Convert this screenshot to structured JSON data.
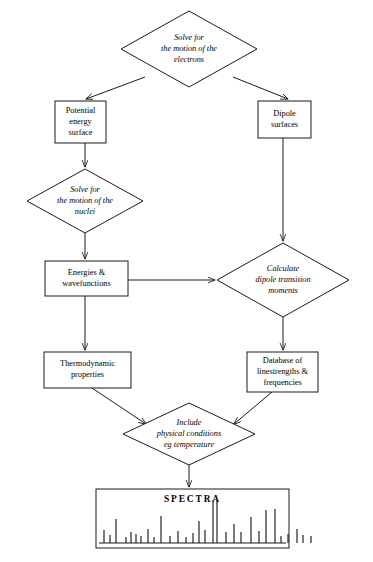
{
  "diagram": {
    "type": "flowchart",
    "colors": {
      "stroke": "#1a1a1a",
      "fill": "#ffffff",
      "background": "#ffffff"
    },
    "nodes": [
      {
        "id": "solve-electrons",
        "shape": "diamond",
        "style": "italic",
        "lines": [
          "Solve for",
          "the motion of the",
          "electrons"
        ],
        "cx": 189,
        "cy": 49,
        "rx": 68,
        "ry": 38
      },
      {
        "id": "potential-energy-surface",
        "shape": "box",
        "style": "roman",
        "lines": [
          "Potential",
          "energy",
          "surface"
        ],
        "x": 55,
        "y": 101,
        "w": 51,
        "h": 42
      },
      {
        "id": "dipole-surfaces",
        "shape": "box",
        "style": "roman",
        "lines": [
          "Dipole",
          "surfaces"
        ],
        "x": 258,
        "y": 101,
        "w": 53,
        "h": 37
      },
      {
        "id": "solve-nuclei",
        "shape": "diamond",
        "style": "italic",
        "lines": [
          "Solve for",
          "the motion of the",
          "nuclei"
        ],
        "cx": 85,
        "cy": 201,
        "rx": 58,
        "ry": 32
      },
      {
        "id": "energies-wavefunctions",
        "shape": "box",
        "style": "roman",
        "lines": [
          "Energies &",
          "wavefunctions"
        ],
        "x": 45,
        "y": 261,
        "w": 83,
        "h": 35
      },
      {
        "id": "calculate-dipole-moments",
        "shape": "diamond",
        "style": "italic",
        "lines": [
          "Calculate",
          "dipole transition",
          "moments"
        ],
        "cx": 283,
        "cy": 280,
        "rx": 66,
        "ry": 37
      },
      {
        "id": "thermodynamic-properties",
        "shape": "box",
        "style": "roman",
        "lines": [
          "Thermodynamic",
          "properties"
        ],
        "x": 44,
        "y": 352,
        "w": 87,
        "h": 36
      },
      {
        "id": "database-linestrengths",
        "shape": "box",
        "style": "roman",
        "lines": [
          "Database of",
          "linestrengths &",
          "frequencies"
        ],
        "x": 247,
        "y": 352,
        "w": 71,
        "h": 40
      },
      {
        "id": "include-physical-conditions",
        "shape": "diamond",
        "style": "italic",
        "lines": [
          "Include",
          "physical conditions",
          "eg temperature"
        ],
        "cx": 189,
        "cy": 434,
        "rx": 66,
        "ry": 31
      },
      {
        "id": "spectra",
        "shape": "box",
        "style": "spectrum",
        "lines": [
          "SPECTRA"
        ],
        "x": 96,
        "y": 489,
        "w": 193,
        "h": 59
      }
    ],
    "edges": [
      {
        "id": "electrons-to-potential",
        "from": "solve-electrons",
        "to": "potential-energy-surface",
        "kind": "diagonal-arrow",
        "path": "M 145 77 L 86 99"
      },
      {
        "id": "electrons-to-dipole",
        "from": "solve-electrons",
        "to": "dipole-surfaces",
        "kind": "diagonal-arrow",
        "path": "M 233 77 L 288 99"
      },
      {
        "id": "potential-to-nuclei",
        "from": "potential-energy-surface",
        "to": "solve-nuclei",
        "kind": "vertical-arrow",
        "path": "M 85 143 L 85 167"
      },
      {
        "id": "nuclei-to-energies",
        "from": "solve-nuclei",
        "to": "energies-wavefunctions",
        "kind": "vertical-arrow",
        "path": "M 85 233 L 85 259"
      },
      {
        "id": "dipole-to-calculate",
        "from": "dipole-surfaces",
        "to": "calculate-dipole-moments",
        "kind": "vertical-arrow",
        "path": "M 283 138 L 283 241"
      },
      {
        "id": "energies-to-calculate",
        "from": "energies-wavefunctions",
        "to": "calculate-dipole-moments",
        "kind": "horizontal-arrow",
        "path": "M 128 280 L 215 280"
      },
      {
        "id": "energies-to-thermo",
        "from": "energies-wavefunctions",
        "to": "thermodynamic-properties",
        "kind": "vertical-arrow",
        "path": "M 85 296 L 85 350"
      },
      {
        "id": "calculate-to-database",
        "from": "calculate-dipole-moments",
        "to": "database-linestrengths",
        "kind": "vertical-arrow",
        "path": "M 283 317 L 283 350"
      },
      {
        "id": "thermo-to-include",
        "from": "thermodynamic-properties",
        "to": "include-physical-conditions",
        "kind": "diagonal-arrow",
        "path": "M 92 388 L 146 424"
      },
      {
        "id": "database-to-include",
        "from": "database-linestrengths",
        "to": "include-physical-conditions",
        "kind": "diagonal-arrow",
        "path": "M 272 392 L 234 424"
      },
      {
        "id": "include-to-spectra",
        "from": "include-physical-conditions",
        "to": "spectra",
        "kind": "vertical-arrow",
        "path": "M 189 465 L 189 487"
      }
    ],
    "spectrum": {
      "label": "SPECTRA",
      "baseline_y": 543,
      "lines": [
        {
          "x": 104,
          "height": 13
        },
        {
          "x": 110,
          "height": 8
        },
        {
          "x": 116,
          "height": 24
        },
        {
          "x": 126,
          "height": 6
        },
        {
          "x": 131,
          "height": 11
        },
        {
          "x": 136,
          "height": 9
        },
        {
          "x": 141,
          "height": 7
        },
        {
          "x": 148,
          "height": 14
        },
        {
          "x": 154,
          "height": 6
        },
        {
          "x": 161,
          "height": 27
        },
        {
          "x": 170,
          "height": 7
        },
        {
          "x": 178,
          "height": 12
        },
        {
          "x": 186,
          "height": 6
        },
        {
          "x": 193,
          "height": 10
        },
        {
          "x": 199,
          "height": 22
        },
        {
          "x": 205,
          "height": 13
        },
        {
          "x": 213,
          "height": 43
        },
        {
          "x": 217,
          "height": 43
        },
        {
          "x": 226,
          "height": 11
        },
        {
          "x": 234,
          "height": 19
        },
        {
          "x": 241,
          "height": 11
        },
        {
          "x": 251,
          "height": 26
        },
        {
          "x": 259,
          "height": 12
        },
        {
          "x": 266,
          "height": 33
        },
        {
          "x": 275,
          "height": 34
        },
        {
          "x": 281,
          "height": 7
        },
        {
          "x": 288,
          "height": 9
        },
        {
          "x": 297,
          "height": 14
        },
        {
          "x": 303,
          "height": 8
        },
        {
          "x": 311,
          "height": 7
        }
      ]
    }
  }
}
